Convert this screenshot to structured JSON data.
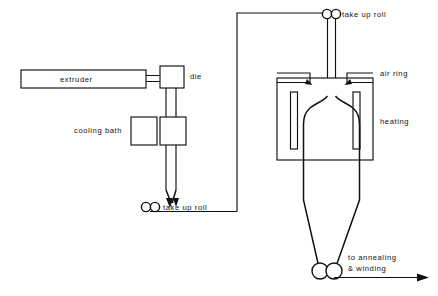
{
  "diagram": {
    "background_color": "#ffffff",
    "line_color": "#111111",
    "labels": {
      "extruder": "extruder",
      "die": "die",
      "cooling_bath": "cooling bath",
      "take_up_roll_lower": "take up roll",
      "take_up_roll_upper": "take up roll",
      "air_ring": "air ring",
      "heating": "heating",
      "to_annealing_line1": "to annealing",
      "to_annealing_line2": "& winding"
    },
    "components": [
      {
        "name": "extruder",
        "label": "extruder",
        "shape": "rectangle"
      },
      {
        "name": "die",
        "label": "die",
        "shape": "rectangle"
      },
      {
        "name": "cooling-bath-left",
        "label": "cooling bath",
        "shape": "rectangle"
      },
      {
        "name": "cooling-bath-right",
        "label": "cooling bath",
        "shape": "rectangle"
      },
      {
        "name": "take-up-roll-lower",
        "label": "take up roll",
        "shape": "roll-pair"
      },
      {
        "name": "take-up-roll-upper",
        "label": "take up roll",
        "shape": "roll-pair"
      },
      {
        "name": "air-ring-left",
        "label": "air ring",
        "shape": "nozzle"
      },
      {
        "name": "air-ring-right",
        "label": "air ring",
        "shape": "nozzle"
      },
      {
        "name": "heating-chamber",
        "label": "heating",
        "shape": "rectangle"
      },
      {
        "name": "heater-element-left",
        "label": "heating",
        "shape": "bar"
      },
      {
        "name": "heater-element-right",
        "label": "heating",
        "shape": "bar"
      },
      {
        "name": "bubble",
        "label": "film bubble",
        "shape": "dome"
      },
      {
        "name": "nip-roll-pair",
        "label": "nip rolls",
        "shape": "roll-pair"
      },
      {
        "name": "output-arrow",
        "label": "to annealing & winding",
        "shape": "arrow"
      }
    ]
  }
}
